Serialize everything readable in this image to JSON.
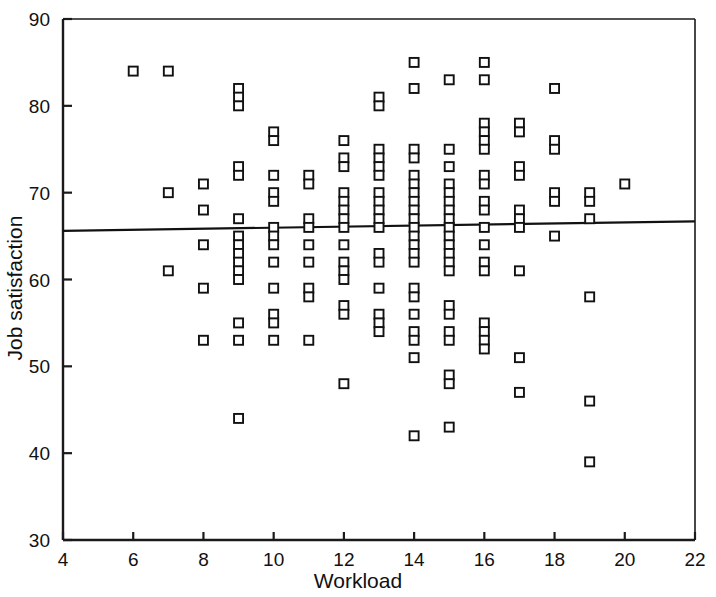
{
  "chart_data": {
    "type": "scatter",
    "title": "",
    "xlabel": "Workload",
    "ylabel": "Job satisfaction",
    "xlim": [
      4,
      22
    ],
    "ylim": [
      30,
      90
    ],
    "xticks": [
      4,
      6,
      8,
      10,
      12,
      14,
      16,
      18,
      20,
      22
    ],
    "yticks": [
      30,
      40,
      50,
      60,
      70,
      80,
      90
    ],
    "grid": false,
    "legend": null,
    "marker": "open-square",
    "marker_color": "#111111",
    "background_color": "#ffffff",
    "trendline": {
      "label": "linear fit",
      "x": [
        4,
        22
      ],
      "y": [
        65.6,
        66.7
      ],
      "color": "#111111"
    },
    "points": [
      {
        "x": 6,
        "y": 84
      },
      {
        "x": 7,
        "y": 84
      },
      {
        "x": 7,
        "y": 70
      },
      {
        "x": 7,
        "y": 61
      },
      {
        "x": 8,
        "y": 71
      },
      {
        "x": 8,
        "y": 68
      },
      {
        "x": 8,
        "y": 64
      },
      {
        "x": 8,
        "y": 59
      },
      {
        "x": 8,
        "y": 53
      },
      {
        "x": 9,
        "y": 82
      },
      {
        "x": 9,
        "y": 81
      },
      {
        "x": 9,
        "y": 80
      },
      {
        "x": 9,
        "y": 73
      },
      {
        "x": 9,
        "y": 72
      },
      {
        "x": 9,
        "y": 67
      },
      {
        "x": 9,
        "y": 65
      },
      {
        "x": 9,
        "y": 64
      },
      {
        "x": 9,
        "y": 63
      },
      {
        "x": 9,
        "y": 62
      },
      {
        "x": 9,
        "y": 61
      },
      {
        "x": 9,
        "y": 60
      },
      {
        "x": 9,
        "y": 55
      },
      {
        "x": 9,
        "y": 53
      },
      {
        "x": 9,
        "y": 44
      },
      {
        "x": 10,
        "y": 77
      },
      {
        "x": 10,
        "y": 76
      },
      {
        "x": 10,
        "y": 72
      },
      {
        "x": 10,
        "y": 70
      },
      {
        "x": 10,
        "y": 69
      },
      {
        "x": 10,
        "y": 66
      },
      {
        "x": 10,
        "y": 65
      },
      {
        "x": 10,
        "y": 64
      },
      {
        "x": 10,
        "y": 62
      },
      {
        "x": 10,
        "y": 59
      },
      {
        "x": 10,
        "y": 56
      },
      {
        "x": 10,
        "y": 55
      },
      {
        "x": 10,
        "y": 53
      },
      {
        "x": 11,
        "y": 72
      },
      {
        "x": 11,
        "y": 71
      },
      {
        "x": 11,
        "y": 67
      },
      {
        "x": 11,
        "y": 66
      },
      {
        "x": 11,
        "y": 64
      },
      {
        "x": 11,
        "y": 62
      },
      {
        "x": 11,
        "y": 59
      },
      {
        "x": 11,
        "y": 58
      },
      {
        "x": 11,
        "y": 53
      },
      {
        "x": 12,
        "y": 76
      },
      {
        "x": 12,
        "y": 74
      },
      {
        "x": 12,
        "y": 73
      },
      {
        "x": 12,
        "y": 70
      },
      {
        "x": 12,
        "y": 69
      },
      {
        "x": 12,
        "y": 68
      },
      {
        "x": 12,
        "y": 67
      },
      {
        "x": 12,
        "y": 66
      },
      {
        "x": 12,
        "y": 64
      },
      {
        "x": 12,
        "y": 62
      },
      {
        "x": 12,
        "y": 61
      },
      {
        "x": 12,
        "y": 60
      },
      {
        "x": 12,
        "y": 57
      },
      {
        "x": 12,
        "y": 56
      },
      {
        "x": 12,
        "y": 48
      },
      {
        "x": 13,
        "y": 81
      },
      {
        "x": 13,
        "y": 80
      },
      {
        "x": 13,
        "y": 75
      },
      {
        "x": 13,
        "y": 74
      },
      {
        "x": 13,
        "y": 73
      },
      {
        "x": 13,
        "y": 72
      },
      {
        "x": 13,
        "y": 70
      },
      {
        "x": 13,
        "y": 69
      },
      {
        "x": 13,
        "y": 68
      },
      {
        "x": 13,
        "y": 67
      },
      {
        "x": 13,
        "y": 66
      },
      {
        "x": 13,
        "y": 63
      },
      {
        "x": 13,
        "y": 62
      },
      {
        "x": 13,
        "y": 59
      },
      {
        "x": 13,
        "y": 56
      },
      {
        "x": 13,
        "y": 55
      },
      {
        "x": 13,
        "y": 54
      },
      {
        "x": 14,
        "y": 85
      },
      {
        "x": 14,
        "y": 82
      },
      {
        "x": 14,
        "y": 75
      },
      {
        "x": 14,
        "y": 74
      },
      {
        "x": 14,
        "y": 72
      },
      {
        "x": 14,
        "y": 71
      },
      {
        "x": 14,
        "y": 70
      },
      {
        "x": 14,
        "y": 69
      },
      {
        "x": 14,
        "y": 68
      },
      {
        "x": 14,
        "y": 67
      },
      {
        "x": 14,
        "y": 66
      },
      {
        "x": 14,
        "y": 65
      },
      {
        "x": 14,
        "y": 64
      },
      {
        "x": 14,
        "y": 63
      },
      {
        "x": 14,
        "y": 62
      },
      {
        "x": 14,
        "y": 59
      },
      {
        "x": 14,
        "y": 58
      },
      {
        "x": 14,
        "y": 56
      },
      {
        "x": 14,
        "y": 54
      },
      {
        "x": 14,
        "y": 53
      },
      {
        "x": 14,
        "y": 51
      },
      {
        "x": 14,
        "y": 42
      },
      {
        "x": 15,
        "y": 83
      },
      {
        "x": 15,
        "y": 75
      },
      {
        "x": 15,
        "y": 73
      },
      {
        "x": 15,
        "y": 71
      },
      {
        "x": 15,
        "y": 70
      },
      {
        "x": 15,
        "y": 69
      },
      {
        "x": 15,
        "y": 68
      },
      {
        "x": 15,
        "y": 67
      },
      {
        "x": 15,
        "y": 66
      },
      {
        "x": 15,
        "y": 65
      },
      {
        "x": 15,
        "y": 64
      },
      {
        "x": 15,
        "y": 63
      },
      {
        "x": 15,
        "y": 62
      },
      {
        "x": 15,
        "y": 61
      },
      {
        "x": 15,
        "y": 57
      },
      {
        "x": 15,
        "y": 56
      },
      {
        "x": 15,
        "y": 54
      },
      {
        "x": 15,
        "y": 53
      },
      {
        "x": 15,
        "y": 49
      },
      {
        "x": 15,
        "y": 48
      },
      {
        "x": 15,
        "y": 43
      },
      {
        "x": 16,
        "y": 85
      },
      {
        "x": 16,
        "y": 83
      },
      {
        "x": 16,
        "y": 78
      },
      {
        "x": 16,
        "y": 77
      },
      {
        "x": 16,
        "y": 76
      },
      {
        "x": 16,
        "y": 75
      },
      {
        "x": 16,
        "y": 72
      },
      {
        "x": 16,
        "y": 71
      },
      {
        "x": 16,
        "y": 69
      },
      {
        "x": 16,
        "y": 68
      },
      {
        "x": 16,
        "y": 66
      },
      {
        "x": 16,
        "y": 64
      },
      {
        "x": 16,
        "y": 62
      },
      {
        "x": 16,
        "y": 61
      },
      {
        "x": 16,
        "y": 55
      },
      {
        "x": 16,
        "y": 54
      },
      {
        "x": 16,
        "y": 53
      },
      {
        "x": 16,
        "y": 52
      },
      {
        "x": 17,
        "y": 78
      },
      {
        "x": 17,
        "y": 77
      },
      {
        "x": 17,
        "y": 73
      },
      {
        "x": 17,
        "y": 72
      },
      {
        "x": 17,
        "y": 68
      },
      {
        "x": 17,
        "y": 67
      },
      {
        "x": 17,
        "y": 66
      },
      {
        "x": 17,
        "y": 61
      },
      {
        "x": 17,
        "y": 51
      },
      {
        "x": 17,
        "y": 47
      },
      {
        "x": 18,
        "y": 82
      },
      {
        "x": 18,
        "y": 76
      },
      {
        "x": 18,
        "y": 75
      },
      {
        "x": 18,
        "y": 70
      },
      {
        "x": 18,
        "y": 69
      },
      {
        "x": 18,
        "y": 65
      },
      {
        "x": 19,
        "y": 70
      },
      {
        "x": 19,
        "y": 69
      },
      {
        "x": 19,
        "y": 67
      },
      {
        "x": 19,
        "y": 58
      },
      {
        "x": 19,
        "y": 46
      },
      {
        "x": 19,
        "y": 39
      },
      {
        "x": 20,
        "y": 71
      }
    ]
  },
  "axes": {
    "x_title": "Workload",
    "y_title": "Job satisfaction",
    "x_tick_labels": [
      "4",
      "6",
      "8",
      "10",
      "12",
      "14",
      "16",
      "18",
      "20",
      "22"
    ],
    "y_tick_labels": [
      "30",
      "40",
      "50",
      "60",
      "70",
      "80",
      "90"
    ]
  }
}
